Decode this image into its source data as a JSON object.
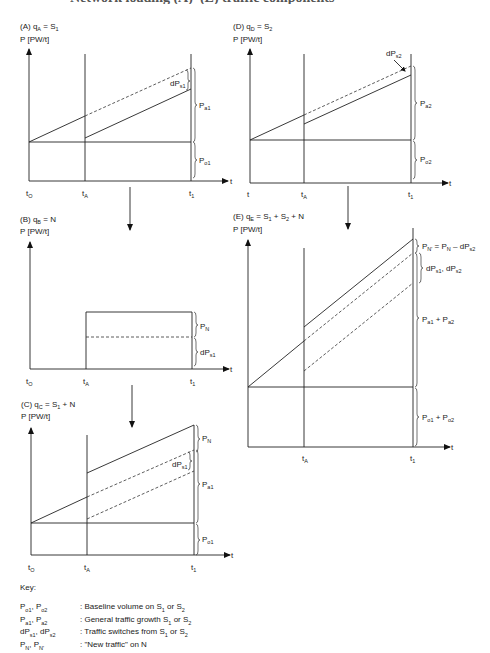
{
  "title": "Network loading (A)–(E) traffic components",
  "panels": {
    "A": {
      "label": "(A) q",
      "label_sub": "A",
      "eq": " = S",
      "eq_sub": "1",
      "yaxis": "P [PW/t]",
      "x_ticks": [
        "t",
        "t",
        "t"
      ],
      "x_tick_subs": [
        "O",
        "A",
        "1"
      ],
      "x_axis": "t",
      "braces": [
        {
          "text": "dP",
          "sub": "s1"
        },
        {
          "text": "P",
          "sub": "a1"
        },
        {
          "text": "P",
          "sub": "o1"
        }
      ]
    },
    "B": {
      "label": "(B) q",
      "label_sub": "B",
      "eq": " = N",
      "eq_sub": "",
      "yaxis": "P [PW/t]",
      "x_ticks": [
        "t",
        "t",
        "t"
      ],
      "x_tick_subs": [
        "O",
        "A",
        "1"
      ],
      "x_axis": "t",
      "braces": [
        {
          "text": "P",
          "sub": "N"
        },
        {
          "text": "dP",
          "sub": "s1"
        }
      ]
    },
    "C": {
      "label": "(C) q",
      "label_sub": "C",
      "eq": " = S",
      "eq_sub": "1",
      "eq_tail": " + N",
      "yaxis": "P [PW/t]",
      "x_ticks": [
        "t",
        "t",
        "t"
      ],
      "x_tick_subs": [
        "O",
        "A",
        "1"
      ],
      "x_axis": "t",
      "braces": [
        {
          "text": "P",
          "sub": "N"
        },
        {
          "text": "dP",
          "sub": "s1"
        },
        {
          "text": "P",
          "sub": "a1"
        },
        {
          "text": "P",
          "sub": "o1"
        }
      ]
    },
    "D": {
      "label": "(D) q",
      "label_sub": "D",
      "eq": " = S",
      "eq_sub": "2",
      "yaxis": "P [PW/t]",
      "x_ticks": [
        "t",
        "t",
        "t"
      ],
      "x_tick_subs": [
        "",
        "A",
        "1"
      ],
      "x_axis": "t",
      "braces": [
        {
          "text": "dP",
          "sub": "s2"
        },
        {
          "text": "P",
          "sub": "a2"
        },
        {
          "text": "P",
          "sub": "o2"
        }
      ]
    },
    "E": {
      "label": "(E) q",
      "label_sub": "E",
      "eq": " = S",
      "eq_sub": "1",
      "eq_mid": " + S",
      "eq_mid_sub": "2",
      "eq_tail": " + N",
      "yaxis": "P [PW/t]",
      "x_ticks": [
        "t",
        "t"
      ],
      "x_tick_subs": [
        "A",
        "1"
      ],
      "x_axis": "t",
      "braces": [
        {
          "text": "P",
          "sub": "N'",
          "rest": " = P",
          "rest_sub": "N",
          "rest2": " – dP",
          "rest2_sub": "s2"
        },
        {
          "text": "dP",
          "sub": "s1",
          "rest": ", dP",
          "rest_sub": "s2"
        },
        {
          "text": "P",
          "sub": "a1",
          "rest": " + P",
          "rest_sub": "a2"
        },
        {
          "text": "P",
          "sub": "o1",
          "rest": " + P",
          "rest_sub": "o2"
        }
      ]
    }
  },
  "key": {
    "title": "Key:",
    "rows": [
      {
        "sym": "P",
        "s1": "o1",
        "sym2": ", P",
        "s2": "o2",
        "desc": ": Baseline volume on S",
        "d1": "1",
        "desc2": " or S",
        "d2": "2"
      },
      {
        "sym": "P",
        "s1": "a1",
        "sym2": ", P",
        "s2": "a2",
        "desc": ": General traffic growth S",
        "d1": "1",
        "desc2": " or S",
        "d2": "2"
      },
      {
        "sym": "dP",
        "s1": "s1",
        "sym2": ", dP",
        "s2": "s2",
        "desc": ": Traffic switches from S",
        "d1": "1",
        "desc2": " or S",
        "d2": "2"
      },
      {
        "sym": "P",
        "s1": "N",
        "sym2": ", P",
        "s2": "N'",
        "desc": ": \"New traffic\" on N",
        "d1": "",
        "desc2": "",
        "d2": ""
      }
    ]
  },
  "colors": {
    "line": "#222222",
    "background": "#ffffff"
  }
}
